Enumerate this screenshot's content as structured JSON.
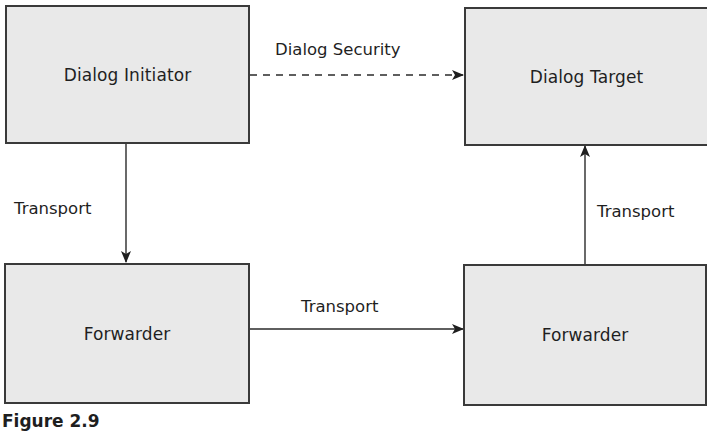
{
  "diagram": {
    "nodes": [
      {
        "id": "initiator",
        "label": "Dialog Initiator"
      },
      {
        "id": "target",
        "label": "Dialog Target"
      },
      {
        "id": "forwarder_left",
        "label": "Forwarder"
      },
      {
        "id": "forwarder_right",
        "label": "Forwarder"
      }
    ],
    "edges": [
      {
        "from": "initiator",
        "to": "target",
        "label": "Dialog Security",
        "style": "dashed"
      },
      {
        "from": "initiator",
        "to": "forwarder_left",
        "label": "Transport",
        "style": "solid"
      },
      {
        "from": "forwarder_left",
        "to": "forwarder_right",
        "label": "Transport",
        "style": "solid"
      },
      {
        "from": "forwarder_right",
        "to": "target",
        "label": "Transport",
        "style": "solid"
      }
    ],
    "caption": "Figure 2.9"
  },
  "colors": {
    "box_fill": "#e9e9e9",
    "box_border": "#3a3a3a",
    "line": "#2a2a2a",
    "text": "#1f1f1f"
  }
}
